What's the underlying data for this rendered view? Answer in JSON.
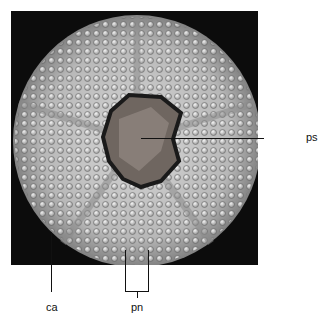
{
  "figure": {
    "labels": {
      "ca": "ca",
      "pn": "pn",
      "ps": "ps"
    },
    "colors": {
      "background": "#0c0c0c",
      "test": "#c8c8c8",
      "periproct": "#7a7068"
    }
  }
}
